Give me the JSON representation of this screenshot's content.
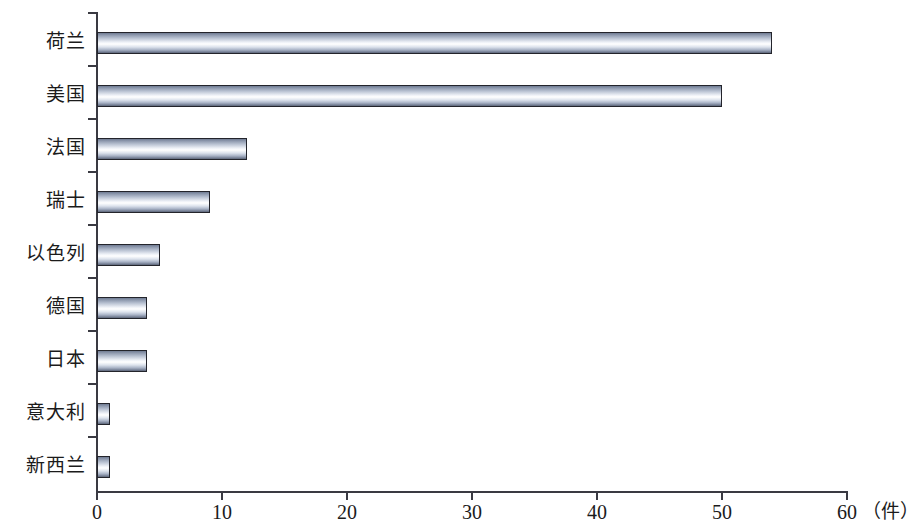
{
  "chart_data": {
    "type": "bar",
    "orientation": "horizontal",
    "title": "",
    "xlabel": "（件）",
    "ylabel": "",
    "categories": [
      "荷兰",
      "美国",
      "法国",
      "瑞士",
      "以色列",
      "德国",
      "日本",
      "意大利",
      "新西兰"
    ],
    "values": [
      54,
      50,
      12,
      9,
      5,
      4,
      4,
      1,
      1
    ],
    "series": [
      {
        "name": "件数",
        "values": [
          54,
          50,
          12,
          9,
          5,
          4,
          4,
          1,
          1
        ]
      }
    ],
    "xlim": [
      0,
      60
    ],
    "xticks": [
      0,
      10,
      20,
      30,
      40,
      50,
      60
    ],
    "xtick_labels": [
      "0",
      "10",
      "20",
      "30",
      "40",
      "50",
      "60"
    ],
    "grid": false,
    "legend": false,
    "unit_note": "（件）",
    "bar_style": {
      "fill": "cylinder-gradient",
      "edge_color": "#23242b",
      "highlight_color": "#ffffff",
      "shadow_color": "#5c6578",
      "mid_color": "#b9c2d2"
    },
    "axis_color": "#3a3a42",
    "background": "#ffffff"
  }
}
